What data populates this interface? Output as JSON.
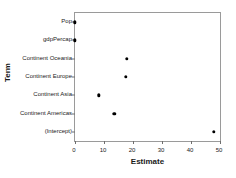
{
  "chart_data": {
    "type": "scatter",
    "title": "",
    "xlabel": "Estimate",
    "ylabel": "Term",
    "xlim": [
      0,
      50
    ],
    "xticks": [
      0,
      10,
      20,
      30,
      40,
      50
    ],
    "xtick_labels": [
      "0",
      "10",
      "20",
      "30",
      "40",
      "50"
    ],
    "grid": false,
    "legend": null,
    "point_color": "#000000",
    "panel_border_color": "#9a9a9a",
    "categories": [
      "Pop",
      "gdpPercap",
      "Continent Oceania",
      "Continent Europe",
      "Continent Asia",
      "Continent Americas",
      "(Intercept)"
    ],
    "values": [
      0.0,
      0.0,
      17.8,
      17.5,
      8.3,
      13.6,
      47.8
    ],
    "points": [
      {
        "term": "Pop",
        "estimate": 0.0
      },
      {
        "term": "gdpPercap",
        "estimate": 0.0
      },
      {
        "term": "Continent Oceania",
        "estimate": 17.8
      },
      {
        "term": "Continent Europe",
        "estimate": 17.5
      },
      {
        "term": "Continent Asia",
        "estimate": 8.3
      },
      {
        "term": "Continent Americas",
        "estimate": 13.6
      },
      {
        "term": "(Intercept)",
        "estimate": 47.8
      }
    ]
  }
}
